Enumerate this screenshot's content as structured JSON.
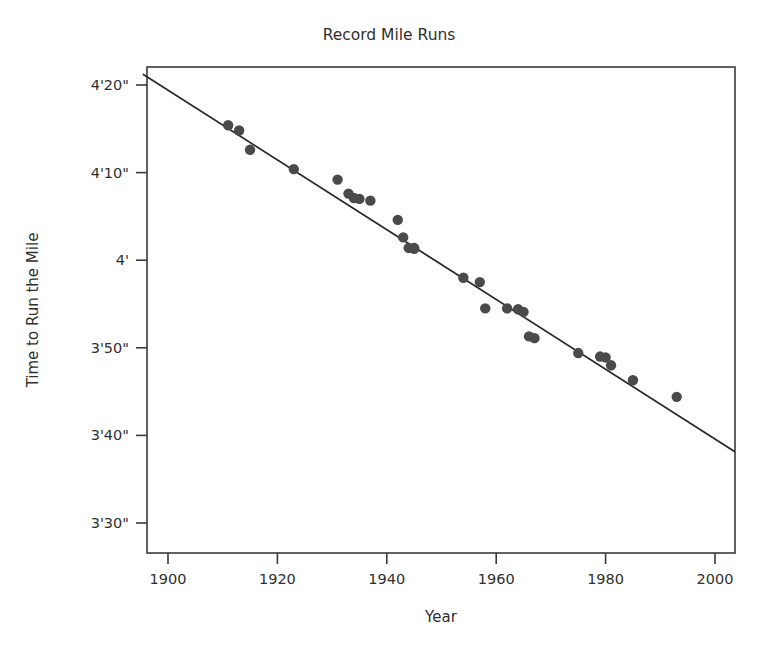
{
  "chart_data": {
    "type": "scatter",
    "title": "Record Mile Runs",
    "xlabel": "Year",
    "ylabel": "Time to Run the Mile",
    "xlim": [
      1894,
      2004
    ],
    "ylim": [
      205,
      265
    ],
    "grid": false,
    "legend": null,
    "x_ticks": [
      1900,
      1920,
      1940,
      1960,
      1980,
      2000
    ],
    "x_tick_labels": [
      "1900",
      "1920",
      "1940",
      "1960",
      "1980",
      "2000"
    ],
    "y_ticks": [
      260,
      250,
      240,
      230,
      220,
      210
    ],
    "y_tick_labels": [
      "4'20\"",
      "4'10\"",
      "4'",
      "3'50\"",
      "3'40\"",
      "3'30\""
    ],
    "y_unit_note": "seconds; tick values are minutes'seconds\"",
    "point_label": "record mile time",
    "x": [
      1911,
      1913,
      1915,
      1923,
      1931,
      1933,
      1934,
      1935,
      1937,
      1942,
      1943,
      1944,
      1945,
      1945,
      1954,
      1957,
      1958,
      1962,
      1964,
      1965,
      1966,
      1967,
      1975,
      1979,
      1980,
      1981,
      1985,
      1993
    ],
    "values": [
      255.4,
      254.8,
      252.6,
      250.4,
      249.2,
      247.6,
      247.1,
      247.0,
      246.8,
      244.6,
      242.6,
      241.4,
      241.4,
      241.3,
      238.0,
      237.5,
      234.5,
      234.5,
      234.4,
      234.1,
      231.3,
      231.1,
      229.4,
      229.0,
      228.9,
      228.0,
      226.3,
      224.4
    ],
    "series": [
      {
        "name": "Record mile times",
        "kind": "scatter",
        "points": [
          {
            "year": 1911,
            "time_seconds": 255.4,
            "time_label": "4'15.4\""
          },
          {
            "year": 1913,
            "time_seconds": 254.8,
            "time_label": "4'14.8\""
          },
          {
            "year": 1915,
            "time_seconds": 252.6,
            "time_label": "4'12.6\""
          },
          {
            "year": 1923,
            "time_seconds": 250.4,
            "time_label": "4'10.4\""
          },
          {
            "year": 1931,
            "time_seconds": 249.2,
            "time_label": "4'09.2\""
          },
          {
            "year": 1933,
            "time_seconds": 247.6,
            "time_label": "4'07.6\""
          },
          {
            "year": 1934,
            "time_seconds": 247.1,
            "time_label": "4'07.1\""
          },
          {
            "year": 1935,
            "time_seconds": 247.0,
            "time_label": "4'07.0\""
          },
          {
            "year": 1937,
            "time_seconds": 246.8,
            "time_label": "4'06.8\""
          },
          {
            "year": 1942,
            "time_seconds": 244.6,
            "time_label": "4'04.6\""
          },
          {
            "year": 1943,
            "time_seconds": 242.6,
            "time_label": "4'02.6\""
          },
          {
            "year": 1944,
            "time_seconds": 241.4,
            "time_label": "4'01.4\""
          },
          {
            "year": 1945,
            "time_seconds": 241.4,
            "time_label": "4'01.4\""
          },
          {
            "year": 1945,
            "time_seconds": 241.3,
            "time_label": "4'01.3\""
          },
          {
            "year": 1954,
            "time_seconds": 238.0,
            "time_label": "3'58.0\""
          },
          {
            "year": 1957,
            "time_seconds": 237.5,
            "time_label": "3'57.5\""
          },
          {
            "year": 1958,
            "time_seconds": 234.5,
            "time_label": "3'54.5\""
          },
          {
            "year": 1962,
            "time_seconds": 234.5,
            "time_label": "3'54.5\""
          },
          {
            "year": 1964,
            "time_seconds": 234.4,
            "time_label": "3'54.4\""
          },
          {
            "year": 1965,
            "time_seconds": 234.1,
            "time_label": "3'54.1\""
          },
          {
            "year": 1966,
            "time_seconds": 231.3,
            "time_label": "3'51.3\""
          },
          {
            "year": 1967,
            "time_seconds": 231.1,
            "time_label": "3'51.1\""
          },
          {
            "year": 1975,
            "time_seconds": 229.4,
            "time_label": "3'49.4\""
          },
          {
            "year": 1979,
            "time_seconds": 229.0,
            "time_label": "3'49.0\""
          },
          {
            "year": 1980,
            "time_seconds": 228.9,
            "time_label": "3'48.9\""
          },
          {
            "year": 1981,
            "time_seconds": 228.0,
            "time_label": "3'48.0\""
          },
          {
            "year": 1985,
            "time_seconds": 226.3,
            "time_label": "3'46.3\""
          },
          {
            "year": 1993,
            "time_seconds": 224.4,
            "time_label": "3'44.4\""
          }
        ]
      },
      {
        "name": "Least-squares trend line",
        "kind": "line",
        "endpoints": [
          {
            "year": 1895.5,
            "time_seconds": 261.2
          },
          {
            "year": 2003.5,
            "time_seconds": 218.2
          }
        ]
      }
    ]
  }
}
